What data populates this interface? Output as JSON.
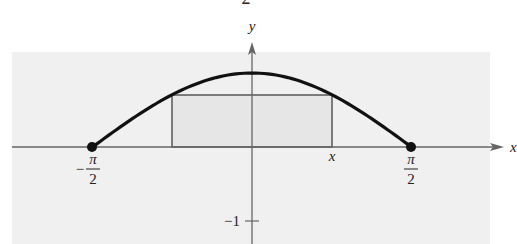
{
  "figure": {
    "top_fragment": "2",
    "axis_labels": {
      "x": "x",
      "y": "y"
    },
    "tick_labels": {
      "left_num": "π",
      "left_den": "2",
      "left_sign": "−",
      "right_num": "π",
      "right_den": "2",
      "x_point": "x",
      "y_neg1": "−1"
    },
    "colors": {
      "panel": "#f0f0f0",
      "curve": "#111111",
      "axis": "#666666",
      "rect_fill": "#e6e6e6",
      "rect_stroke": "#333333"
    }
  },
  "chart_data": {
    "type": "line",
    "title": "",
    "function": "y = cos(x)",
    "xlabel": "x",
    "ylabel": "y",
    "domain": [
      -1.5708,
      1.5708
    ],
    "x_ticks": [
      "−π/2",
      "x",
      "π/2"
    ],
    "y_ticks": [
      "−1"
    ],
    "x": [
      -1.5708,
      -1.1781,
      -0.7854,
      -0.3927,
      0,
      0.3927,
      0.7854,
      1.1781,
      1.5708
    ],
    "values": [
      0,
      0.3827,
      0.7071,
      0.9239,
      1,
      0.9239,
      0.7071,
      0.3827,
      0
    ],
    "endpoints": [
      [
        -1.5708,
        0
      ],
      [
        1.5708,
        0
      ]
    ],
    "inscribed_rectangle": {
      "x_left": -0.79,
      "x_right": 0.79,
      "height": 0.7
    },
    "ylim": [
      -1.2,
      1.25
    ],
    "grid": false,
    "legend": null
  }
}
